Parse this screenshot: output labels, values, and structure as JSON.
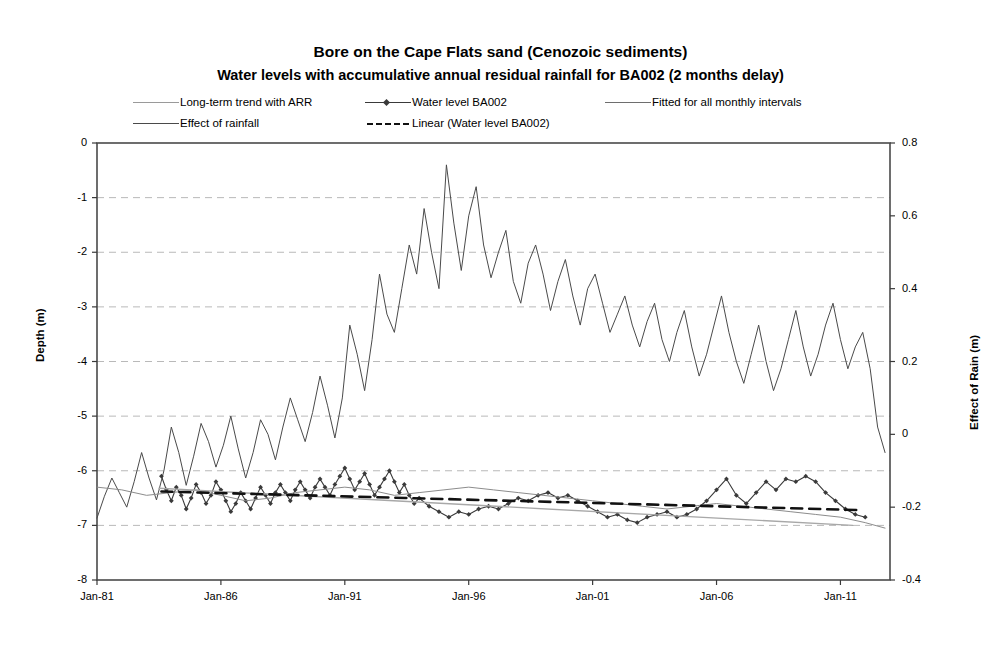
{
  "title": {
    "main": "Bore on the Cape Flats sand (Cenozoic sediments)",
    "sub": "Water levels with accumulative annual residual rainfall for BA002 (2 months delay)"
  },
  "legend": [
    {
      "label": "Long-term trend with ARR",
      "style": "solid-thin",
      "color": "#8c8c8c"
    },
    {
      "label": "Water level BA002",
      "style": "solid-marker",
      "color": "#3a3a3a"
    },
    {
      "label": "Fitted for all monthly intervals",
      "style": "solid-thin",
      "color": "#6e6e6e"
    },
    {
      "label": "Effect of rainfall",
      "style": "solid-thin",
      "color": "#4a4a4a"
    },
    {
      "label": "Linear (Water level BA002)",
      "style": "dashed",
      "color": "#111111"
    }
  ],
  "chart_data": {
    "type": "line",
    "title": "Bore on the Cape Flats sand (Cenozoic sediments)",
    "subtitle": "Water levels with accumulative annual residual rainfall for BA002 (2 months delay)",
    "xlabel": "",
    "ylabel": "Depth (m)",
    "y2label": "Effect of Rain (m)",
    "grid": true,
    "legend_position": "top",
    "xlim": [
      "Jan-81",
      "Jan-13"
    ],
    "xticks": [
      "Jan-81",
      "Jan-86",
      "Jan-91",
      "Jan-96",
      "Jan-01",
      "Jan-06",
      "Jan-11"
    ],
    "xtick_years": [
      1981,
      1986,
      1991,
      1996,
      2001,
      2006,
      2011
    ],
    "ylim": [
      -8,
      0
    ],
    "yticks": [
      0,
      -1,
      -2,
      -3,
      -4,
      -5,
      -6,
      -7,
      -8
    ],
    "ytick_labels": [
      "0",
      "-1",
      "-2",
      "-3",
      "-4",
      "-5",
      "-6",
      "-7",
      "-8"
    ],
    "y2lim": [
      -0.4,
      0.8
    ],
    "y2ticks": [
      0.8,
      0.6,
      0.4,
      0.2,
      0,
      -0.2,
      -0.4
    ],
    "y2tick_labels": [
      "0.8",
      "0.6",
      "0.4",
      "0.2",
      "0",
      "-0.2",
      "-0.4"
    ],
    "series": [
      {
        "name": "Effect of rainfall",
        "axis": "right",
        "color": "#4a4a4a",
        "width": 1.0,
        "style": "solid",
        "x": [
          1981.0,
          1981.3,
          1981.6,
          1981.9,
          1982.2,
          1982.5,
          1982.8,
          1983.1,
          1983.4,
          1983.7,
          1984.0,
          1984.3,
          1984.6,
          1984.9,
          1985.2,
          1985.5,
          1985.8,
          1986.1,
          1986.4,
          1986.7,
          1987.0,
          1987.3,
          1987.6,
          1987.9,
          1988.2,
          1988.5,
          1988.8,
          1989.1,
          1989.4,
          1989.7,
          1990.0,
          1990.3,
          1990.6,
          1990.9,
          1991.2,
          1991.5,
          1991.8,
          1992.1,
          1992.4,
          1992.7,
          1993.0,
          1993.3,
          1993.6,
          1993.9,
          1994.2,
          1994.5,
          1994.8,
          1995.1,
          1995.4,
          1995.7,
          1996.0,
          1996.3,
          1996.6,
          1996.9,
          1997.2,
          1997.5,
          1997.8,
          1998.1,
          1998.4,
          1998.7,
          1999.0,
          1999.3,
          1999.6,
          1999.9,
          2000.2,
          2000.5,
          2000.8,
          2001.1,
          2001.4,
          2001.7,
          2002.0,
          2002.3,
          2002.6,
          2002.9,
          2003.2,
          2003.5,
          2003.8,
          2004.1,
          2004.4,
          2004.7,
          2005.0,
          2005.3,
          2005.6,
          2005.9,
          2006.2,
          2006.5,
          2006.8,
          2007.1,
          2007.4,
          2007.7,
          2008.0,
          2008.3,
          2008.6,
          2008.9,
          2009.2,
          2009.5,
          2009.8,
          2010.1,
          2010.4,
          2010.7,
          2011.0,
          2011.3,
          2011.6,
          2011.9,
          2012.2,
          2012.5,
          2012.8
        ],
        "y": [
          -0.23,
          -0.17,
          -0.12,
          -0.16,
          -0.2,
          -0.13,
          -0.05,
          -0.12,
          -0.18,
          -0.1,
          0.02,
          -0.05,
          -0.14,
          -0.06,
          0.03,
          -0.02,
          -0.09,
          -0.03,
          0.05,
          -0.04,
          -0.12,
          -0.05,
          0.04,
          0.0,
          -0.07,
          0.02,
          0.1,
          0.04,
          -0.02,
          0.06,
          0.16,
          0.08,
          -0.01,
          0.1,
          0.3,
          0.22,
          0.12,
          0.26,
          0.44,
          0.33,
          0.28,
          0.4,
          0.52,
          0.44,
          0.62,
          0.5,
          0.4,
          0.74,
          0.58,
          0.45,
          0.6,
          0.68,
          0.52,
          0.43,
          0.5,
          0.56,
          0.42,
          0.36,
          0.47,
          0.52,
          0.44,
          0.34,
          0.42,
          0.48,
          0.38,
          0.3,
          0.4,
          0.44,
          0.36,
          0.28,
          0.33,
          0.38,
          0.3,
          0.24,
          0.31,
          0.36,
          0.26,
          0.2,
          0.28,
          0.34,
          0.24,
          0.16,
          0.22,
          0.3,
          0.38,
          0.28,
          0.2,
          0.14,
          0.22,
          0.3,
          0.2,
          0.12,
          0.18,
          0.26,
          0.34,
          0.24,
          0.16,
          0.22,
          0.3,
          0.36,
          0.26,
          0.18,
          0.24,
          0.28,
          0.18,
          0.02,
          -0.05
        ]
      },
      {
        "name": "Water level BA002",
        "axis": "left",
        "color": "#3a3a3a",
        "width": 1.1,
        "style": "solid-marker",
        "x": [
          1983.6,
          1983.8,
          1984.0,
          1984.2,
          1984.4,
          1984.6,
          1984.8,
          1985.0,
          1985.2,
          1985.4,
          1985.6,
          1985.8,
          1986.0,
          1986.2,
          1986.4,
          1986.6,
          1986.8,
          1987.0,
          1987.2,
          1987.4,
          1987.6,
          1987.8,
          1988.0,
          1988.2,
          1988.4,
          1988.6,
          1988.8,
          1989.0,
          1989.2,
          1989.4,
          1989.6,
          1989.8,
          1990.0,
          1990.2,
          1990.4,
          1990.6,
          1990.8,
          1991.0,
          1991.2,
          1991.4,
          1991.6,
          1991.8,
          1992.0,
          1992.2,
          1992.4,
          1992.6,
          1992.8,
          1993.0,
          1993.2,
          1993.4,
          1993.6,
          1993.8,
          1994.0,
          1994.4,
          1994.8,
          1995.2,
          1995.6,
          1996.0,
          1996.4,
          1996.8,
          1997.2,
          1997.6,
          1998.0,
          1998.4,
          1998.8,
          1999.2,
          1999.6,
          2000.0,
          2000.4,
          2000.8,
          2001.2,
          2001.6,
          2002.0,
          2002.4,
          2002.8,
          2003.2,
          2003.6,
          2004.0,
          2004.4,
          2004.8,
          2005.2,
          2005.6,
          2006.0,
          2006.4,
          2006.8,
          2007.2,
          2007.6,
          2008.0,
          2008.4,
          2008.8,
          2009.2,
          2009.6,
          2010.0,
          2010.4,
          2010.8,
          2011.2,
          2011.6,
          2012.0
        ],
        "y": [
          -6.1,
          -6.35,
          -6.55,
          -6.3,
          -6.45,
          -6.7,
          -6.5,
          -6.25,
          -6.4,
          -6.6,
          -6.45,
          -6.2,
          -6.35,
          -6.55,
          -6.75,
          -6.6,
          -6.4,
          -6.55,
          -6.7,
          -6.5,
          -6.3,
          -6.45,
          -6.6,
          -6.4,
          -6.25,
          -6.4,
          -6.55,
          -6.35,
          -6.2,
          -6.35,
          -6.5,
          -6.3,
          -6.15,
          -6.3,
          -6.45,
          -6.25,
          -6.1,
          -5.95,
          -6.15,
          -6.35,
          -6.2,
          -6.05,
          -6.25,
          -6.45,
          -6.3,
          -6.15,
          -6.0,
          -6.2,
          -6.4,
          -6.25,
          -6.45,
          -6.6,
          -6.5,
          -6.65,
          -6.75,
          -6.85,
          -6.75,
          -6.8,
          -6.7,
          -6.65,
          -6.7,
          -6.6,
          -6.5,
          -6.55,
          -6.45,
          -6.4,
          -6.5,
          -6.45,
          -6.55,
          -6.65,
          -6.75,
          -6.85,
          -6.8,
          -6.9,
          -6.95,
          -6.85,
          -6.8,
          -6.75,
          -6.85,
          -6.8,
          -6.7,
          -6.55,
          -6.35,
          -6.15,
          -6.45,
          -6.6,
          -6.4,
          -6.2,
          -6.35,
          -6.15,
          -6.2,
          -6.1,
          -6.2,
          -6.4,
          -6.55,
          -6.7,
          -6.8,
          -6.85
        ]
      },
      {
        "name": "Long-term trend with ARR",
        "axis": "left",
        "color": "#8c8c8c",
        "width": 1.0,
        "style": "solid",
        "x": [
          1981.0,
          1982.0,
          1983.0,
          1984.0,
          1985.0,
          1986.0,
          1987.0,
          1988.0,
          1989.0,
          1990.0,
          1991.0,
          1992.0,
          1993.0,
          1994.0,
          1995.0,
          1996.0,
          1997.0,
          1998.0,
          1999.0,
          2000.0,
          2001.0,
          2002.0,
          2003.0,
          2004.0,
          2005.0,
          2006.0,
          2007.0,
          2008.0,
          2009.0,
          2010.0,
          2011.0,
          2012.0,
          2012.8
        ],
        "y": [
          -6.3,
          -6.35,
          -6.45,
          -6.4,
          -6.35,
          -6.45,
          -6.55,
          -6.5,
          -6.4,
          -6.35,
          -6.3,
          -6.35,
          -6.45,
          -6.4,
          -6.35,
          -6.3,
          -6.35,
          -6.4,
          -6.45,
          -6.5,
          -6.55,
          -6.6,
          -6.65,
          -6.7,
          -6.65,
          -6.6,
          -6.65,
          -6.7,
          -6.75,
          -6.8,
          -6.85,
          -6.95,
          -7.05
        ]
      },
      {
        "name": "Fitted for all monthly intervals",
        "axis": "left",
        "color": "#a8a8a8",
        "width": 1.4,
        "style": "solid",
        "x": [
          1983.5,
          2011.5
        ],
        "y": [
          -6.32,
          -7.0
        ]
      },
      {
        "name": "Linear (Water level BA002)",
        "axis": "left",
        "color": "#111111",
        "width": 2.6,
        "style": "dashed",
        "x": [
          1983.6,
          2011.8
        ],
        "y": [
          -6.38,
          -6.72
        ]
      }
    ]
  }
}
